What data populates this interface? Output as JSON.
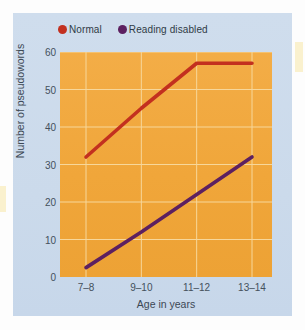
{
  "figure": {
    "panel_background": "#ccdcec",
    "plot_background": "#f0a63a"
  },
  "legend": {
    "position": "top-left",
    "items": [
      {
        "label": "Normal",
        "color": "#c3301f",
        "marker": "legend-dot-normal"
      },
      {
        "label": "Reading disabled",
        "color": "#5d2060",
        "marker": "legend-dot-reading-disabled"
      }
    ]
  },
  "axes": {
    "ylabel": "Number of pseudowords",
    "xlabel": "Age in years",
    "yticks": [
      "0",
      "10",
      "20",
      "30",
      "40",
      "50",
      "60"
    ],
    "xticks": [
      "7–8",
      "9–10",
      "11–12",
      "13–14"
    ]
  },
  "chart_data": {
    "type": "line",
    "title": "",
    "xlabel": "Age in years",
    "ylabel": "Number of pseudowords",
    "categories": [
      "7–8",
      "9–10",
      "11–12",
      "13–14"
    ],
    "series": [
      {
        "name": "Normal",
        "color": "#c3301f",
        "values": [
          32,
          45,
          57,
          57
        ]
      },
      {
        "name": "Reading disabled",
        "color": "#5d2060",
        "values": [
          2.5,
          12,
          22,
          32
        ]
      }
    ],
    "ylim": [
      0,
      60
    ],
    "ytick_values": [
      0,
      10,
      20,
      30,
      40,
      50,
      60
    ],
    "grid": true,
    "grid_color": "#f7d79a",
    "legend_position": "top-left"
  }
}
